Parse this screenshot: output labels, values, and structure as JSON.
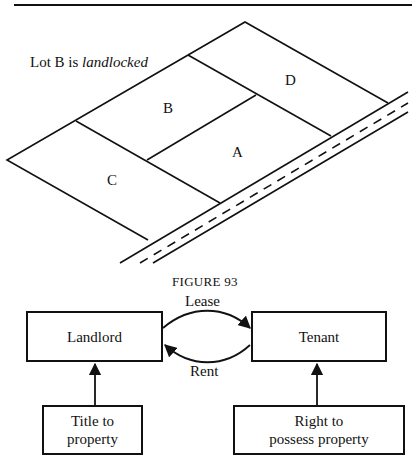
{
  "figure_top": {
    "note_prefix": "Lot B is ",
    "note_emphasis": "landlocked",
    "lots": [
      {
        "id": "A",
        "label": "A"
      },
      {
        "id": "B",
        "label": "B"
      },
      {
        "id": "C",
        "label": "C"
      },
      {
        "id": "D",
        "label": "D"
      }
    ],
    "caption": "FIGURE 93"
  },
  "figure_bottom": {
    "landlord": "Landlord",
    "tenant": "Tenant",
    "lease_label": "Lease",
    "rent_label": "Rent",
    "title_line1": "Title to",
    "title_line2": "property",
    "right_line1": "Right to",
    "right_line2": "possess property"
  },
  "colors": {
    "ink": "#111111",
    "paper": "#ffffff"
  }
}
